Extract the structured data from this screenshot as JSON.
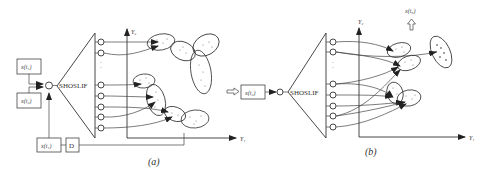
{
  "diagram": {
    "panels": [
      {
        "id": "a",
        "caption": "(a)",
        "inputs": [
          "x(t₁)",
          "x(t₂)"
        ],
        "feedback_input": "x(t₁)",
        "delay_label": "D",
        "network_label": "SHOSLIF",
        "axis_x": "Y₁",
        "axis_y": "Y₂"
      },
      {
        "id": "b",
        "caption": "(b)",
        "input": "x(t₂)",
        "network_label": "SHOSLIF",
        "output_label": "x(t₃)",
        "axis_x": "Y₁",
        "axis_y": "Y₂"
      }
    ]
  }
}
